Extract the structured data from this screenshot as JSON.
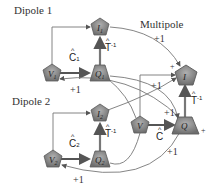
{
  "titles": {
    "dipole1": "Dipole 1",
    "dipole2": "Dipole 2",
    "multipole": "Multipole"
  },
  "nodes": {
    "I1": {
      "label": "I",
      "sub": "1",
      "shape": "pentagon"
    },
    "V1": {
      "label": "V",
      "sub": "1",
      "shape": "pentagon"
    },
    "Q1": {
      "label": "Q",
      "sub": "1",
      "shape": "trapezoid"
    },
    "I2": {
      "label": "I",
      "sub": "2",
      "shape": "pentagon"
    },
    "V2": {
      "label": "V",
      "sub": "2",
      "shape": "pentagon"
    },
    "Q2": {
      "label": "Q",
      "sub": "2",
      "shape": "trapezoid"
    },
    "I": {
      "label": "I",
      "sub": "",
      "shape": "pentagon"
    },
    "V": {
      "label": "V",
      "sub": "",
      "shape": "pentagon"
    },
    "Q": {
      "label": "Q",
      "sub": "",
      "shape": "trapezoid"
    }
  },
  "edge_labels": {
    "C1": {
      "hat": "^",
      "text": "C",
      "sub": "1"
    },
    "C2": {
      "hat": "^",
      "text": "C",
      "sub": "2"
    },
    "C": {
      "hat": "^",
      "text": "C",
      "sub": ""
    },
    "T1": {
      "hat": "^",
      "text": "T",
      "sup": "-1"
    },
    "T2": {
      "hat": "^",
      "text": "T",
      "sup": "-1"
    },
    "T": {
      "hat": "^",
      "text": "T",
      "sup": "-1"
    },
    "plus_top": "+1",
    "plus_d1": "+1",
    "plus_mid": "+1",
    "plus_right": "+1",
    "plus_lower": "+1",
    "plus_d2": "+1",
    "plus_I": "+",
    "plus_Q": "+"
  },
  "colors": {
    "node_fill": "#8a8a8a",
    "node_stroke": "#5a5a5a",
    "edge": "#666666",
    "bold_edge": "#555555",
    "text": "#333333"
  }
}
